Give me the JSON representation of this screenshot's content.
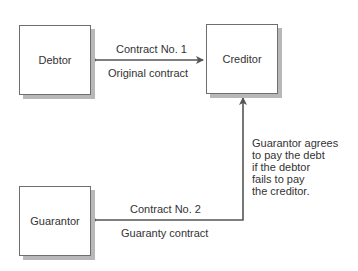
{
  "diagram": {
    "nodes": {
      "debtor": {
        "label": "Debtor"
      },
      "creditor": {
        "label": "Creditor"
      },
      "guarantor": {
        "label": "Guarantor"
      }
    },
    "edges": {
      "contract1": {
        "title": "Contract No. 1",
        "subtitle": "Original contract",
        "from": "Debtor",
        "to": "Creditor",
        "direction": "bidirectional"
      },
      "contract2": {
        "title": "Contract No. 2",
        "subtitle": "Guaranty contract",
        "from": "Guarantor",
        "to": "Creditor",
        "direction": "bidirectional"
      }
    },
    "annotation": {
      "lines": [
        "Guarantor agrees",
        "to pay the debt",
        "if the debtor",
        "fails to pay",
        "the creditor."
      ]
    },
    "colors": {
      "line": "#555555",
      "box_border": "#6e6e6e",
      "shadow": "#b8b8b8",
      "text": "#333333"
    }
  }
}
